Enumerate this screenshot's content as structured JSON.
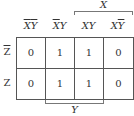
{
  "kmap": {
    "column_headers": [
      {
        "x": "X",
        "x_bar": true,
        "y": "Y",
        "y_bar": true
      },
      {
        "x": "X",
        "x_bar": true,
        "y": "Y",
        "y_bar": false
      },
      {
        "x": "X",
        "x_bar": false,
        "y": "Y",
        "y_bar": false
      },
      {
        "x": "X",
        "x_bar": false,
        "y": "Y",
        "y_bar": true
      }
    ],
    "row_headers": [
      {
        "label": "Z",
        "bar": true
      },
      {
        "label": "Z",
        "bar": false
      }
    ],
    "cells": [
      [
        "0",
        "1",
        "1",
        "0"
      ],
      [
        "0",
        "1",
        "1",
        "0"
      ]
    ],
    "x_brace_label": "X",
    "y_brace_label": "Y"
  }
}
